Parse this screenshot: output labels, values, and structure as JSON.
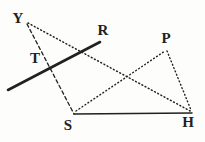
{
  "figure": {
    "background": "#fdfdfc",
    "ink": "#212121",
    "canvas": {
      "width": 205,
      "height": 142
    },
    "stroke_styles": {
      "dashed": "3.5 2.8",
      "dotted": "0.9 2.7"
    },
    "labels": [
      {
        "text": "Y",
        "x": 18,
        "y": 18
      },
      {
        "text": "T",
        "x": 35,
        "y": 58
      },
      {
        "text": "R",
        "x": 103,
        "y": 30
      },
      {
        "text": "P",
        "x": 166,
        "y": 38
      },
      {
        "text": "S",
        "x": 68,
        "y": 125
      },
      {
        "text": "H",
        "x": 188,
        "y": 122
      }
    ],
    "segments": [
      {
        "name": "line-through-T-ending-at-R",
        "style": "solid",
        "width": 2.6,
        "x1": 8,
        "y1": 90,
        "x2": 100,
        "y2": 42
      },
      {
        "name": "segment-Y-S-through-T",
        "style": "dashed",
        "width": 1.3,
        "x1": 27,
        "y1": 24,
        "x2": 74,
        "y2": 114
      },
      {
        "name": "segment-Y-H",
        "style": "dotted",
        "width": 1.5,
        "x1": 28,
        "y1": 23,
        "x2": 192,
        "y2": 112
      },
      {
        "name": "segment-S-P",
        "style": "dotted",
        "width": 1.4,
        "x1": 76,
        "y1": 111,
        "x2": 165,
        "y2": 51
      },
      {
        "name": "segment-P-H",
        "style": "dotted",
        "width": 1.4,
        "x1": 167,
        "y1": 51,
        "x2": 191,
        "y2": 110
      },
      {
        "name": "segment-S-H",
        "style": "solid",
        "width": 1.5,
        "x1": 74,
        "y1": 114,
        "x2": 192,
        "y2": 113
      }
    ]
  }
}
